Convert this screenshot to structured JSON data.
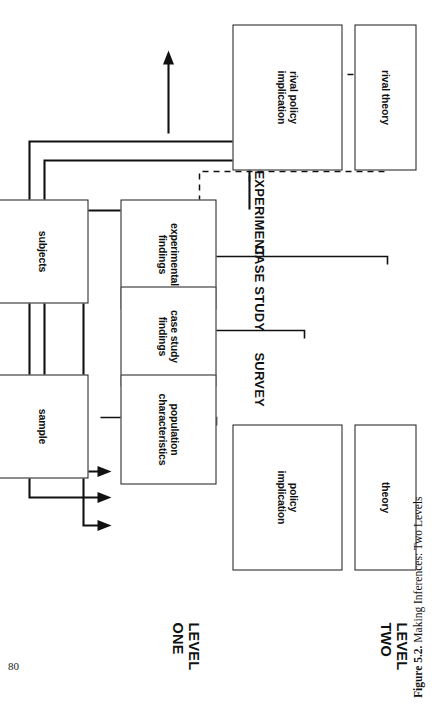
{
  "page": {
    "number": "80",
    "caption_label": "Figure 5.2.",
    "caption_text": "Making Inferences: Two Levels"
  },
  "levels": [
    {
      "id": "level-two",
      "label": "LEVEL\nTWO"
    },
    {
      "id": "level-one",
      "label": "LEVEL\nONE"
    }
  ],
  "designs": [
    {
      "id": "survey",
      "label": "SURVEY"
    },
    {
      "id": "case-study",
      "label": "CASE STUDY"
    },
    {
      "id": "experiment",
      "label": "EXPERIMENT"
    }
  ],
  "boxes": [
    {
      "id": "theory",
      "label": "theory"
    },
    {
      "id": "policy-implication",
      "label": "policy\nimplication"
    },
    {
      "id": "rival-theory",
      "label": "rival theory"
    },
    {
      "id": "rival-policy",
      "label": "rival policy\nimplication"
    },
    {
      "id": "population",
      "label": "population\ncharacteristics"
    },
    {
      "id": "sample",
      "label": "sample"
    },
    {
      "id": "case-study-findings",
      "label": "case study\nfindings"
    },
    {
      "id": "experimental-findings",
      "label": "experimental\nfindings"
    },
    {
      "id": "subjects",
      "label": "subjects"
    }
  ],
  "arrows": {
    "solid_count": 5,
    "dashed_count": 3,
    "solid_targets": "policy implication",
    "dashed_targets": "rival policy implication"
  },
  "colors": {
    "ink": "#111111",
    "paper": "#ffffff"
  }
}
